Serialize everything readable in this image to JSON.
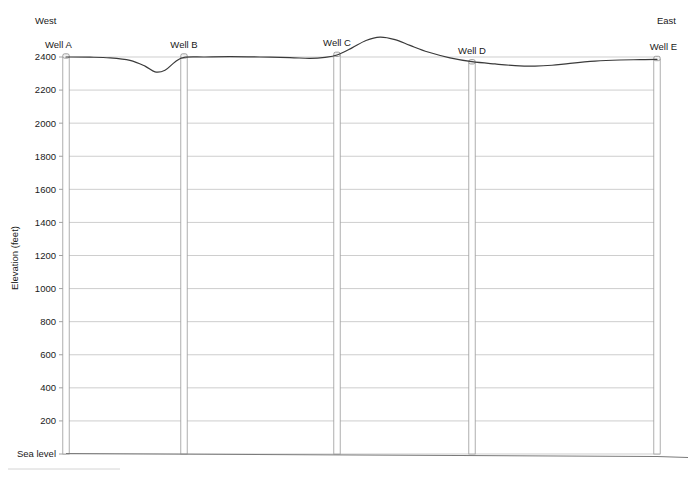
{
  "figure": {
    "kind": "geologic-cross-section",
    "background": "#ffffff",
    "terrain_color": "#3a3a3a",
    "grid_color": "#b9b9b9",
    "well_outline_color": "#9a9a9a"
  },
  "axis": {
    "y_title": "Elevation (feet)",
    "y_ticks": [
      "2400",
      "2200",
      "2000",
      "1800",
      "1600",
      "1400",
      "1200",
      "1000",
      "800",
      "600",
      "400",
      "200",
      "Sea level"
    ],
    "y_values": [
      2400,
      2200,
      2000,
      1800,
      1600,
      1400,
      1200,
      1000,
      800,
      600,
      400,
      200,
      0
    ],
    "y_min_label": "Sea level",
    "y_max_label": "2400",
    "units": "feet"
  },
  "compass": {
    "left": "West",
    "right": "East"
  },
  "wells": [
    {
      "name": "Well A",
      "x_px": 66,
      "collar_elevation": 2400,
      "label_anchor": "start"
    },
    {
      "name": "Well B",
      "x_px": 184,
      "collar_elevation": 2400,
      "label_anchor": "middle"
    },
    {
      "name": "Well C",
      "x_px": 337,
      "collar_elevation": 2410,
      "label_anchor": "middle"
    },
    {
      "name": "Well D",
      "x_px": 472,
      "collar_elevation": 2365,
      "label_anchor": "middle"
    },
    {
      "name": "Well E",
      "x_px": 657,
      "collar_elevation": 2385,
      "label_anchor": "end"
    }
  ],
  "chart_data": {
    "type": "line",
    "title": "",
    "subtitle": "",
    "xlabel": "",
    "ylabel": "Elevation (feet)",
    "ylim": [
      0,
      2400
    ],
    "grid": true,
    "legend_position": "none",
    "annotations": [
      "West",
      "East",
      "Well A",
      "Well B",
      "Well C",
      "Well D",
      "Well E"
    ],
    "series": [
      {
        "name": "Land surface (topographic profile)",
        "x": [
          66,
          90,
          110,
          130,
          145,
          155,
          165,
          175,
          184,
          205,
          230,
          260,
          290,
          310,
          325,
          337,
          352,
          366,
          380,
          395,
          410,
          428,
          450,
          472,
          495,
          515,
          535,
          552,
          570,
          595,
          620,
          640,
          657
        ],
        "values": [
          2400,
          2399,
          2395,
          2380,
          2345,
          2310,
          2320,
          2370,
          2398,
          2400,
          2402,
          2400,
          2396,
          2392,
          2398,
          2412,
          2455,
          2500,
          2520,
          2505,
          2470,
          2430,
          2395,
          2372,
          2358,
          2348,
          2345,
          2350,
          2362,
          2375,
          2382,
          2384,
          2386
        ]
      },
      {
        "name": "Sea level datum",
        "x": [
          66,
          657
        ],
        "values": [
          0,
          0
        ]
      }
    ],
    "gridline_values": [
      2400,
      2200,
      2000,
      1800,
      1600,
      1400,
      1200,
      1000,
      800,
      600,
      400,
      200,
      0
    ],
    "tick_labels": [
      "2400",
      "2200",
      "2000",
      "1800",
      "1600",
      "1400",
      "1200",
      "1000",
      "800",
      "600",
      "400",
      "200",
      "Sea level"
    ]
  }
}
